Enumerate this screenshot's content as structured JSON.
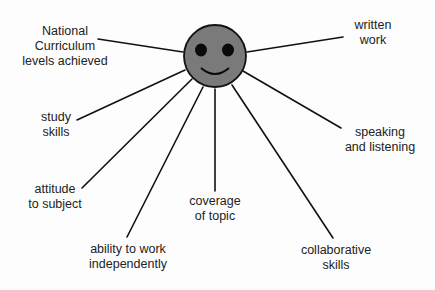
{
  "diagram": {
    "center": {
      "type": "smiley-face",
      "fill": "#7a7a7a",
      "stroke": "#111111"
    },
    "branches": [
      {
        "id": "nc-levels",
        "lines": [
          "National",
          "Curriculum",
          "levels achieved"
        ]
      },
      {
        "id": "written-work",
        "lines": [
          "written",
          "work"
        ]
      },
      {
        "id": "study-skills",
        "lines": [
          "study",
          "skills"
        ]
      },
      {
        "id": "speaking-listening",
        "lines": [
          "speaking",
          "and listening"
        ]
      },
      {
        "id": "attitude",
        "lines": [
          "attitude",
          "to subject"
        ]
      },
      {
        "id": "coverage",
        "lines": [
          "coverage",
          "of topic"
        ]
      },
      {
        "id": "ability",
        "lines": [
          "ability to work",
          "independently"
        ]
      },
      {
        "id": "collaborative",
        "lines": [
          "collaborative",
          "skills"
        ]
      }
    ]
  }
}
